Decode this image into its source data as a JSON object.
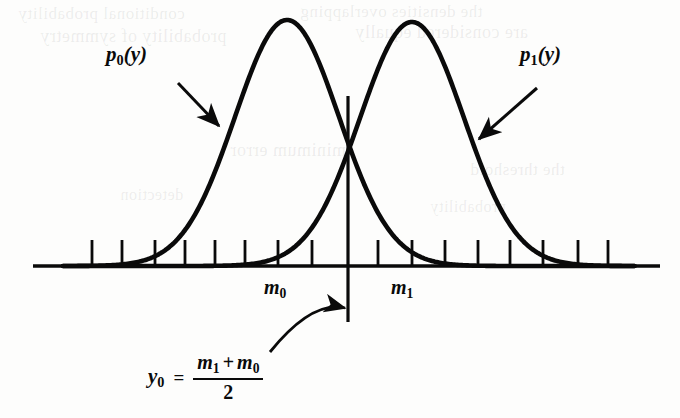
{
  "figure": {
    "background_color": "#fdfdfc",
    "ink_color": "#0a0a0a"
  },
  "labels": {
    "density_0": {
      "base": "p",
      "subscript": "0",
      "arg": "(y)"
    },
    "density_1": {
      "base": "p",
      "subscript": "1",
      "arg": "(y)"
    },
    "mean_0": {
      "base": "m",
      "subscript": "0"
    },
    "mean_1": {
      "base": "m",
      "subscript": "1"
    }
  },
  "formula": {
    "lhs_base": "y",
    "lhs_subscript": "0",
    "equals": "=",
    "numerator_first_base": "m",
    "numerator_first_subscript": "1",
    "operator": "+",
    "numerator_second_base": "m",
    "numerator_second_subscript": "0",
    "denominator": "2"
  },
  "chart_data": {
    "type": "line",
    "title": "",
    "xlabel": "",
    "ylabel": "",
    "grid": false,
    "legend_position": "inline-annotations",
    "axis": {
      "x_start_px": 33,
      "x_end_px": 660,
      "baseline_y_px": 266,
      "tick_height_px": 26,
      "tick_positions_px": [
        92,
        122,
        155,
        185,
        215,
        245,
        278,
        312,
        378,
        412,
        445,
        478,
        510,
        543,
        578,
        608
      ]
    },
    "threshold": {
      "name": "y0",
      "x_px": 348,
      "line_top_px": 96,
      "line_bottom_px": 322,
      "description": "decision threshold at midpoint of the two means"
    },
    "series": [
      {
        "name": "p0(y)",
        "mean_px": 287,
        "peak_px": {
          "x": 287,
          "y": 20
        },
        "sigma_px": 52,
        "amplitude_px": 246,
        "label_position_px": {
          "x": 106,
          "y": 42
        },
        "arrow": {
          "from": {
            "x": 178,
            "y": 83
          },
          "to": {
            "x": 219,
            "y": 126
          }
        },
        "mean_label_position_px": {
          "x": 264,
          "y": 276
        }
      },
      {
        "name": "p1(y)",
        "mean_px": 412,
        "peak_px": {
          "x": 412,
          "y": 22
        },
        "sigma_px": 52,
        "amplitude_px": 244,
        "label_position_px": {
          "x": 520,
          "y": 42
        },
        "arrow": {
          "from": {
            "x": 537,
            "y": 88
          },
          "to": {
            "x": 479,
            "y": 139
          }
        },
        "mean_label_position_px": {
          "x": 391,
          "y": 276
        }
      }
    ],
    "crossing_point_px": {
      "x": 348,
      "y": 140
    },
    "callout_arrow": {
      "from": {
        "x": 270,
        "y": 352
      },
      "control": {
        "x": 312,
        "y": 300
      },
      "to": {
        "x": 345,
        "y": 308
      }
    }
  },
  "bleed_through": [
    {
      "text": "conditional probability",
      "x": 18,
      "y": 4,
      "size": 17
    },
    {
      "text": "the densities overlapping",
      "x": 300,
      "y": 2,
      "size": 17
    },
    {
      "text": "probability of symmetry",
      "x": 40,
      "y": 26,
      "size": 18
    },
    {
      "text": "are considered equally",
      "x": 355,
      "y": 22,
      "size": 18
    },
    {
      "text": "minimum error",
      "x": 230,
      "y": 140,
      "size": 18
    },
    {
      "text": "the threshold",
      "x": 470,
      "y": 160,
      "size": 17
    },
    {
      "text": "detection",
      "x": 120,
      "y": 186,
      "size": 16
    },
    {
      "text": "probability",
      "x": 430,
      "y": 198,
      "size": 16
    }
  ]
}
